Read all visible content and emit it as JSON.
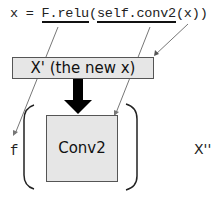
{
  "code_line": {
    "prefix": "x = ",
    "relu": "F.relu",
    "open_paren": "(",
    "conv": "self.conv2",
    "suffix": "(x))"
  },
  "boxes": {
    "new_x": "X' (the new x)",
    "conv2": "Conv2"
  },
  "labels": {
    "f": "f",
    "x_double_prime": "X''"
  },
  "colors": {
    "box_fill": "#e6e6e6",
    "box_border": "#555555",
    "arrow": "#000000",
    "pointer_line": "#777777"
  }
}
